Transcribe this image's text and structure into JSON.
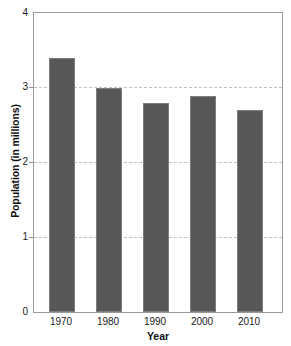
{
  "chart_data": {
    "type": "bar",
    "title": "",
    "xlabel": "Year",
    "ylabel": "Population (in millions)",
    "categories": [
      "1970",
      "1980",
      "1990",
      "2000",
      "2010"
    ],
    "values": [
      3.4,
      3.0,
      2.8,
      2.89,
      2.7
    ],
    "series": [
      {
        "name": "Population",
        "values": [
          3.4,
          3.0,
          2.8,
          2.89,
          2.7
        ]
      }
    ],
    "ylim": [
      0,
      4
    ],
    "y_ticks": [
      "4",
      "3",
      "2",
      "1",
      "0"
    ],
    "y_tick_values": [
      4,
      3,
      2,
      1,
      0
    ],
    "grid": "horizontal-dashed",
    "gridline_values": [
      3,
      2,
      1
    ],
    "legend": "none",
    "bar_color": "#575757",
    "bar_edge_color": "#7e7e7e",
    "gridline_color": "#c2c2c2",
    "frame_color": "#9a9a9a",
    "background_color": "#ffffff"
  }
}
